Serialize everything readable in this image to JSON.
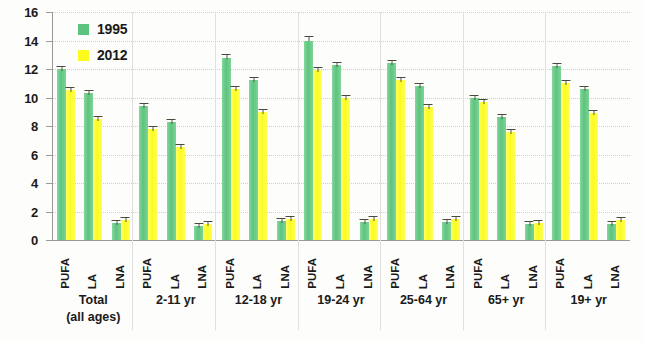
{
  "chart_data": {
    "type": "bar",
    "title": "",
    "xlabel": "",
    "ylabel": "",
    "ylim": [
      0,
      16
    ],
    "yticks": [
      0,
      2,
      4,
      6,
      8,
      10,
      12,
      14,
      16
    ],
    "grid": true,
    "legend_position": "top-left",
    "categories": [
      "PUFA",
      "LA",
      "LNA",
      "PUFA",
      "LA",
      "LNA",
      "PUFA",
      "LA",
      "LNA",
      "PUFA",
      "LA",
      "LNA",
      "PUFA",
      "LA",
      "LNA",
      "PUFA",
      "LA",
      "LNA",
      "PUFA",
      "LA",
      "LNA"
    ],
    "group_labels": [
      "Total\n(all ages)",
      "2-11 yr",
      "12-18 yr",
      "19-24 yr",
      "25-64 yr",
      "65+ yr",
      "19+ yr"
    ],
    "groups": [
      {
        "label_line1": "Total",
        "label_line2": "(all ages)",
        "nutrients": [
          "PUFA",
          "LA",
          "LNA"
        ]
      },
      {
        "label_line1": "2-11 yr",
        "label_line2": "",
        "nutrients": [
          "PUFA",
          "LA",
          "LNA"
        ]
      },
      {
        "label_line1": "12-18 yr",
        "label_line2": "",
        "nutrients": [
          "PUFA",
          "LA",
          "LNA"
        ]
      },
      {
        "label_line1": "19-24 yr",
        "label_line2": "",
        "nutrients": [
          "PUFA",
          "LA",
          "LNA"
        ]
      },
      {
        "label_line1": "25-64 yr",
        "label_line2": "",
        "nutrients": [
          "PUFA",
          "LA",
          "LNA"
        ]
      },
      {
        "label_line1": "65+ yr",
        "label_line2": "",
        "nutrients": [
          "PUFA",
          "LA",
          "LNA"
        ]
      },
      {
        "label_line1": "19+ yr",
        "label_line2": "",
        "nutrients": [
          "PUFA",
          "LA",
          "LNA"
        ]
      }
    ],
    "series": [
      {
        "name": "1995",
        "color": "#5cc47e",
        "values": [
          12.0,
          10.3,
          1.2,
          9.4,
          8.3,
          1.0,
          12.8,
          11.2,
          1.3,
          14.0,
          12.3,
          1.25,
          12.4,
          10.8,
          1.25,
          10.0,
          8.6,
          1.1,
          12.2,
          10.6,
          1.15
        ],
        "errors": [
          0.2,
          0.15,
          0.08,
          0.2,
          0.15,
          0.08,
          0.25,
          0.2,
          0.08,
          0.3,
          0.2,
          0.08,
          0.2,
          0.2,
          0.08,
          0.2,
          0.15,
          0.08,
          0.2,
          0.2,
          0.08
        ]
      },
      {
        "name": "2012",
        "color": "#fbfb1e",
        "values": [
          10.5,
          8.5,
          1.4,
          7.8,
          6.5,
          1.1,
          10.6,
          9.0,
          1.45,
          11.9,
          10.0,
          1.5,
          11.2,
          9.3,
          1.45,
          9.7,
          7.6,
          1.2,
          11.0,
          8.9,
          1.4
        ],
        "errors": [
          0.15,
          0.15,
          0.08,
          0.15,
          0.15,
          0.08,
          0.2,
          0.15,
          0.08,
          0.25,
          0.2,
          0.08,
          0.2,
          0.15,
          0.08,
          0.2,
          0.15,
          0.08,
          0.2,
          0.15,
          0.08
        ]
      }
    ]
  },
  "legend": {
    "items": [
      {
        "label": "1995",
        "swatch": "legend-swatch-1995"
      },
      {
        "label": "2012",
        "swatch": "legend-swatch-2012"
      }
    ]
  }
}
